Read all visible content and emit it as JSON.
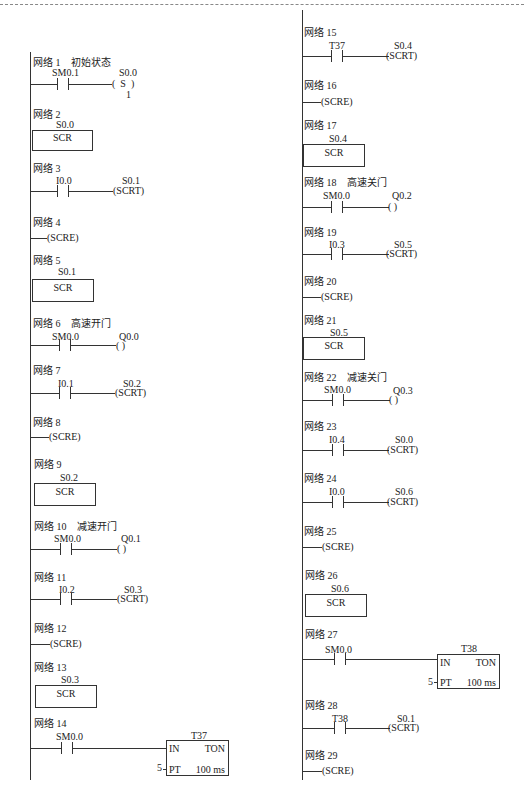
{
  "networks": {
    "n1": {
      "title": "网络 1",
      "comment": "初始状态",
      "contact": "SM0.1",
      "coil_addr": "S0.0",
      "coil_type": "S",
      "coil_n": "1"
    },
    "n2": {
      "title": "网络 2",
      "scr": "S0.0",
      "label": "SCR"
    },
    "n3": {
      "title": "网络 3",
      "contact": "I0.0",
      "coil_addr": "S0.1",
      "coil": "(SCRT)"
    },
    "n4": {
      "title": "网络 4",
      "coil": "(SCRE)"
    },
    "n5": {
      "title": "网络 5",
      "scr": "S0.1",
      "label": "SCR"
    },
    "n6": {
      "title": "网络 6",
      "comment": "高速开门",
      "contact": "SM0.0",
      "coil_addr": "Q0.0",
      "coil": "(        )"
    },
    "n7": {
      "title": "网络 7",
      "contact": "I0.1",
      "coil_addr": "S0.2",
      "coil": "(SCRT)"
    },
    "n8": {
      "title": "网络 8",
      "coil": "(SCRE)"
    },
    "n9": {
      "title": "网络 9",
      "scr": "S0.2",
      "label": "SCR"
    },
    "n10": {
      "title": "网络 10",
      "comment": "减速开门",
      "contact": "SM0.0",
      "coil_addr": "Q0.1",
      "coil": "(        )"
    },
    "n11": {
      "title": "网络 11",
      "contact": "I0.2",
      "coil_addr": "S0.3",
      "coil": "(SCRT)"
    },
    "n12": {
      "title": "网络 12",
      "coil": "(SCRE)"
    },
    "n13": {
      "title": "网络 13",
      "scr": "S0.3",
      "label": "SCR"
    },
    "n14": {
      "title": "网络 14",
      "contact": "SM0.0",
      "timer": "T37",
      "in": "IN",
      "type": "TON",
      "pt": "PT",
      "pt_value": "5",
      "base": "100 ms"
    },
    "n15": {
      "title": "网络 15",
      "contact": "T37",
      "coil_addr": "S0.4",
      "coil": "(SCRT)"
    },
    "n16": {
      "title": "网络 16",
      "coil": "(SCRE)"
    },
    "n17": {
      "title": "网络 17",
      "scr": "S0.4",
      "label": "SCR"
    },
    "n18": {
      "title": "网络 18",
      "comment": "高速关门",
      "contact": "SM0.0",
      "coil_addr": "Q0.2",
      "coil": "(        )"
    },
    "n19": {
      "title": "网络 19",
      "contact": "I0.3",
      "coil_addr": "S0.5",
      "coil": "(SCRT)"
    },
    "n20": {
      "title": "网络 20",
      "coil": "(SCRE)"
    },
    "n21": {
      "title": "网络 21",
      "scr": "S0.5",
      "label": "SCR"
    },
    "n22": {
      "title": "网络 22",
      "comment": "减速关门",
      "contact": "SM0.0",
      "coil_addr": "Q0.3",
      "coil": "(        )"
    },
    "n23": {
      "title": "网络 23",
      "contact": "I0.4",
      "coil_addr": "S0.0",
      "coil": "(SCRT)"
    },
    "n24": {
      "title": "网络 24",
      "contact": "I0.0",
      "coil_addr": "S0.6",
      "coil": "(SCRT)"
    },
    "n25": {
      "title": "网络 25",
      "coil": "(SCRE)"
    },
    "n26": {
      "title": "网络 26",
      "scr": "S0.6",
      "label": "SCR"
    },
    "n27": {
      "title": "网络 27",
      "contact": "SM0.0",
      "timer": "T38",
      "in": "IN",
      "type": "TON",
      "pt": "PT",
      "pt_value": "5",
      "base": "100 ms"
    },
    "n28": {
      "title": "网络 28",
      "contact": "T38",
      "coil_addr": "S0.1",
      "coil": "(SCRT)"
    },
    "n29": {
      "title": "网络 29",
      "coil": "(SCRE)"
    }
  }
}
